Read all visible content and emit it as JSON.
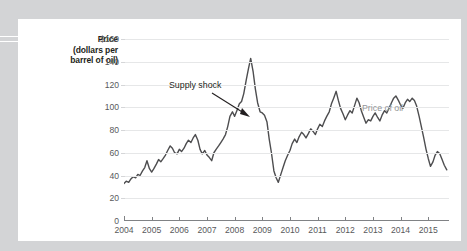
{
  "figure": {
    "axis_title_lines": [
      "Price",
      "(dollars per",
      "barrel of oil)"
    ],
    "annotations": {
      "supply_shock": "Supply shock",
      "series_label": "Price of oil"
    },
    "colors": {
      "line": "#4d4d4f",
      "gridline": "#e6e7e8",
      "axis": "#808285",
      "tick_text": "#58595b",
      "series_label": "#939598",
      "card_background": "#ffffff",
      "page_background": "#d3d4d6"
    }
  },
  "chart_data": {
    "type": "line",
    "title": "",
    "xlabel": "",
    "ylabel": "Price (dollars per barrel of oil)",
    "grid": true,
    "legend_position": "inline-annotation",
    "xlim": [
      2004.0,
      2015.75
    ],
    "ylim": [
      0,
      160
    ],
    "xticks": [
      2004,
      2005,
      2006,
      2007,
      2008,
      2009,
      2010,
      2011,
      2012,
      2013,
      2014,
      2015
    ],
    "xtick_labels": [
      "2004",
      "2005",
      "2006",
      "2007",
      "2008",
      "2009",
      "2010",
      "2011",
      "2012",
      "2013",
      "2014",
      "2015"
    ],
    "yticks": [
      0,
      20,
      40,
      60,
      80,
      100,
      120,
      140,
      160
    ],
    "ytick_labels": [
      "0",
      "20",
      "40",
      "60",
      "80",
      "100",
      "120",
      "140",
      "$160"
    ],
    "series": [
      {
        "name": "Price of oil",
        "color": "#4d4d4f",
        "x": [
          2004.0,
          2004.08,
          2004.17,
          2004.25,
          2004.33,
          2004.42,
          2004.5,
          2004.58,
          2004.67,
          2004.75,
          2004.83,
          2004.92,
          2005.0,
          2005.08,
          2005.17,
          2005.25,
          2005.33,
          2005.42,
          2005.5,
          2005.58,
          2005.67,
          2005.75,
          2005.83,
          2005.92,
          2006.0,
          2006.08,
          2006.17,
          2006.25,
          2006.33,
          2006.42,
          2006.5,
          2006.58,
          2006.67,
          2006.75,
          2006.83,
          2006.92,
          2007.0,
          2007.08,
          2007.17,
          2007.25,
          2007.33,
          2007.42,
          2007.5,
          2007.58,
          2007.67,
          2007.75,
          2007.83,
          2007.92,
          2008.0,
          2008.08,
          2008.17,
          2008.25,
          2008.33,
          2008.42,
          2008.5,
          2008.58,
          2008.67,
          2008.75,
          2008.83,
          2008.92,
          2009.0,
          2009.08,
          2009.17,
          2009.25,
          2009.33,
          2009.42,
          2009.5,
          2009.58,
          2009.67,
          2009.75,
          2009.83,
          2009.92,
          2010.0,
          2010.08,
          2010.17,
          2010.25,
          2010.33,
          2010.42,
          2010.5,
          2010.58,
          2010.67,
          2010.75,
          2010.83,
          2010.92,
          2011.0,
          2011.08,
          2011.17,
          2011.25,
          2011.33,
          2011.42,
          2011.5,
          2011.58,
          2011.67,
          2011.75,
          2011.83,
          2011.92,
          2012.0,
          2012.08,
          2012.17,
          2012.25,
          2012.33,
          2012.42,
          2012.5,
          2012.58,
          2012.67,
          2012.75,
          2012.83,
          2012.92,
          2013.0,
          2013.08,
          2013.17,
          2013.25,
          2013.33,
          2013.42,
          2013.5,
          2013.58,
          2013.67,
          2013.75,
          2013.83,
          2013.92,
          2014.0,
          2014.08,
          2014.17,
          2014.25,
          2014.33,
          2014.42,
          2014.5,
          2014.58,
          2014.67,
          2014.75,
          2014.83,
          2014.92,
          2015.0,
          2015.08,
          2015.17,
          2015.25,
          2015.33,
          2015.42,
          2015.5,
          2015.58,
          2015.67
        ],
        "values": [
          33,
          35,
          34,
          37,
          39,
          38,
          41,
          40,
          44,
          47,
          53,
          46,
          43,
          46,
          50,
          54,
          52,
          55,
          58,
          62,
          66,
          64,
          60,
          59,
          63,
          61,
          64,
          68,
          71,
          69,
          73,
          76,
          71,
          63,
          59,
          62,
          58,
          56,
          53,
          60,
          63,
          66,
          69,
          72,
          76,
          83,
          92,
          96,
          92,
          97,
          103,
          105,
          112,
          124,
          134,
          143,
          131,
          116,
          104,
          96,
          95,
          93,
          87,
          72,
          60,
          44,
          38,
          34,
          41,
          47,
          53,
          58,
          62,
          68,
          72,
          69,
          74,
          78,
          76,
          73,
          77,
          81,
          79,
          76,
          81,
          85,
          83,
          88,
          92,
          96,
          103,
          108,
          114,
          106,
          99,
          94,
          89,
          93,
          97,
          95,
          101,
          108,
          104,
          97,
          91,
          86,
          89,
          88,
          92,
          95,
          91,
          88,
          93,
          97,
          95,
          99,
          104,
          108,
          110,
          106,
          102,
          99,
          104,
          107,
          105,
          108,
          106,
          101,
          92,
          83,
          74,
          63,
          55,
          48,
          52,
          58,
          61,
          59,
          54,
          49,
          45
        ]
      }
    ],
    "annotations": [
      {
        "text": "Supply shock",
        "points_to_x": 2008.05,
        "points_to_y": 97,
        "label_x": 2005.9,
        "label_y": 127
      },
      {
        "text": "Price of oil",
        "label_x": 2012.55,
        "label_y": 116
      }
    ]
  }
}
